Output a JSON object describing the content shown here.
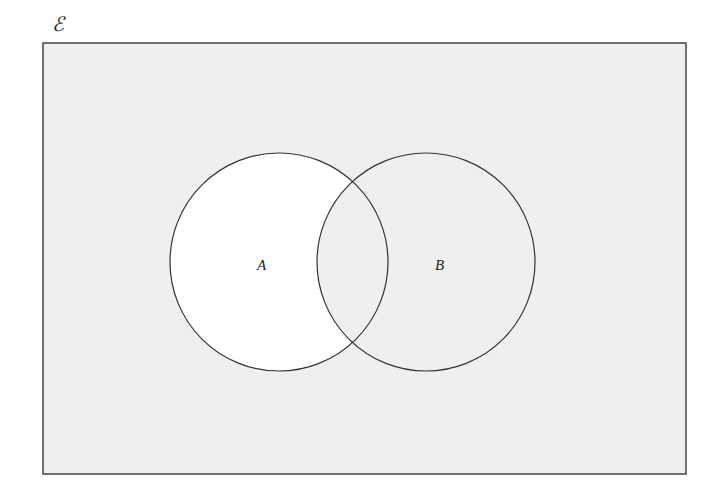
{
  "diagram": {
    "type": "venn",
    "universal_set_label": "ℰ",
    "sets": [
      {
        "name": "A",
        "label": "A"
      },
      {
        "name": "B",
        "label": "B"
      }
    ],
    "shaded_region": "A ∩ B′ (A only) unshaded; rest shaded",
    "colors": {
      "background_shaded": "#efefef",
      "unshaded": "#ffffff",
      "stroke": "#333333"
    }
  }
}
